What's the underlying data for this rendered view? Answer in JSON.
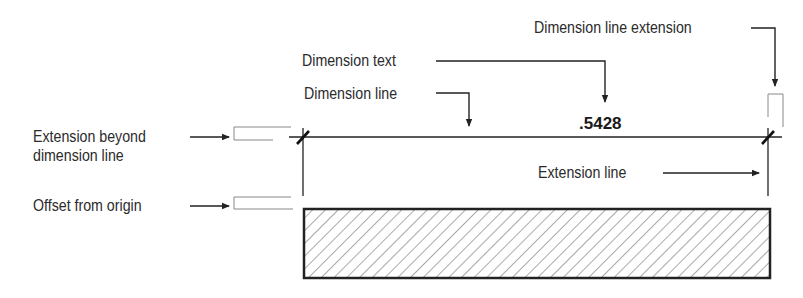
{
  "diagram": {
    "type": "dimensioning-anatomy",
    "dimension_value": ".5428",
    "labels": {
      "dimension_line_extension": "Dimension line extension",
      "dimension_text": "Dimension text",
      "dimension_line": "Dimension line",
      "extension_beyond_dimension_line": "Extension beyond\ndimension line",
      "extension_line": "Extension line",
      "offset_from_origin": "Offset from origin"
    },
    "colors": {
      "line": "#222222",
      "text": "#2b2b2b",
      "hatch": "#555555",
      "bracket": "#888888",
      "background": "#ffffff"
    }
  }
}
